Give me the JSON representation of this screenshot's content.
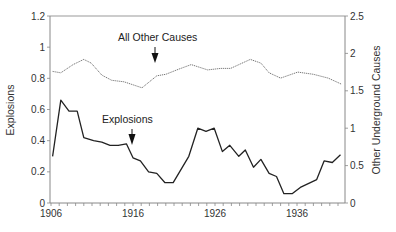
{
  "chart_data": {
    "type": "line",
    "title": "",
    "xlabel": "",
    "ylabel": "Explosions",
    "y2label": "Other Underground Causes",
    "xlim": [
      1906,
      1941.8
    ],
    "ylim": [
      0,
      1.2
    ],
    "y2lim": [
      0,
      2.5
    ],
    "x_ticks": [
      "1906",
      "1916",
      "1926",
      "1936"
    ],
    "y_ticks": [
      "0",
      "0.2",
      "0.4",
      "0.6",
      "0.8",
      "1",
      "1.2"
    ],
    "y2_ticks": [
      "0",
      "0.5",
      "1",
      "1.5",
      "2",
      "2.5"
    ],
    "grid": false,
    "legend": "none (inline annotations)",
    "annotations": [
      {
        "text": "All Other Causes",
        "arrow_year": 1919.3
      },
      {
        "text": "Explosions",
        "arrow_year": 1916.2
      }
    ],
    "series": [
      {
        "name": "Explosions",
        "axis": "left",
        "style": "solid",
        "x": [
          1906.2,
          1907.2,
          1908.2,
          1909.2,
          1910.0,
          1911.2,
          1912.2,
          1913.2,
          1914.2,
          1915.2,
          1916.0,
          1916.9,
          1917.9,
          1918.9,
          1919.9,
          1920.9,
          1922.8,
          1923.9,
          1924.9,
          1925.9,
          1926.9,
          1927.8,
          1928.9,
          1929.7,
          1930.7,
          1931.6,
          1932.6,
          1933.5,
          1934.4,
          1935.4,
          1936.4,
          1938.4,
          1939.3,
          1940.3,
          1941.3
        ],
        "values": [
          0.3,
          0.66,
          0.59,
          0.59,
          0.42,
          0.4,
          0.39,
          0.37,
          0.37,
          0.38,
          0.29,
          0.27,
          0.2,
          0.19,
          0.13,
          0.13,
          0.3,
          0.48,
          0.46,
          0.48,
          0.33,
          0.37,
          0.3,
          0.34,
          0.23,
          0.28,
          0.19,
          0.17,
          0.06,
          0.06,
          0.1,
          0.15,
          0.27,
          0.26,
          0.31
        ]
      },
      {
        "name": "All Other Causes",
        "axis": "right",
        "style": "dotted",
        "x": [
          1906.2,
          1907.2,
          1908.7,
          1910.0,
          1910.9,
          1912.2,
          1913.4,
          1914.9,
          1917.1,
          1918.9,
          1920.0,
          1921.6,
          1923.1,
          1925.1,
          1926.7,
          1927.9,
          1930.3,
          1931.6,
          1932.6,
          1934.0,
          1936.1,
          1938.0,
          1939.8,
          1941.4
        ],
        "values": [
          1.76,
          1.74,
          1.85,
          1.92,
          1.87,
          1.71,
          1.64,
          1.62,
          1.54,
          1.7,
          1.72,
          1.79,
          1.85,
          1.78,
          1.8,
          1.8,
          1.92,
          1.87,
          1.74,
          1.67,
          1.75,
          1.72,
          1.67,
          1.59
        ]
      }
    ]
  },
  "labels": {
    "y_axis_title": "Explosions",
    "y2_axis_title": "Other Underground Causes",
    "annotation_other": "All Other Causes",
    "annotation_explosions": "Explosions"
  },
  "colors": {
    "explosions_line": "#222222",
    "other_line": "#777777",
    "axis": "#888888",
    "text": "#333333"
  }
}
